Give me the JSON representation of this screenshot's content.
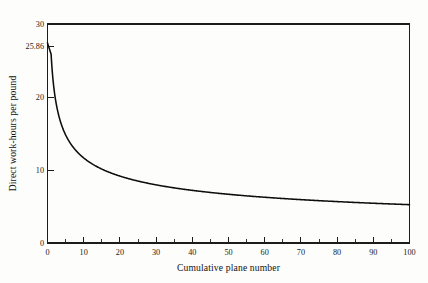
{
  "figure": {
    "background_color": "#fdfdfb",
    "ink_color": "#0d0d0d"
  },
  "chart_data": {
    "type": "line",
    "title": "",
    "subtitle": "",
    "xlabel": "Cumulative plane number",
    "ylabel": "Direct work-hours per pound",
    "xlim": [
      0,
      100
    ],
    "ylim": [
      0,
      30
    ],
    "grid": false,
    "legend": null,
    "x_ticks": [
      0,
      10,
      20,
      30,
      40,
      50,
      60,
      70,
      80,
      90,
      100
    ],
    "x_tick_labels": [
      "0",
      "10",
      "20",
      "30",
      "40",
      "50",
      "60",
      "70",
      "80",
      "90",
      "100"
    ],
    "x_minor_ticks": [
      5,
      15,
      25,
      35,
      45,
      55,
      65,
      75,
      85,
      95
    ],
    "y_ticks": [
      0,
      10,
      20,
      25.86,
      30
    ],
    "y_tick_labels": [
      "0",
      "10",
      "20",
      "25.86",
      "30"
    ],
    "annotations": [
      {
        "label": "25.86",
        "value": 25.86,
        "note": "first-unit direct work-hours per pound"
      }
    ],
    "series": [
      {
        "name": "Learning curve",
        "model": "y = 25.86 * n^(-0.352)",
        "x": [
          1,
          2,
          3,
          4,
          5,
          6,
          8,
          10,
          12,
          15,
          20,
          25,
          30,
          35,
          40,
          45,
          50,
          55,
          60,
          65,
          70,
          75,
          80,
          85,
          90,
          95,
          100
        ],
        "y": [
          25.86,
          20.26,
          17.63,
          15.88,
          14.65,
          13.72,
          12.38,
          11.44,
          10.75,
          9.96,
          8.97,
          8.29,
          7.78,
          7.38,
          7.06,
          6.79,
          6.56,
          6.36,
          6.18,
          6.02,
          5.88,
          5.75,
          5.63,
          5.53,
          5.43,
          5.34,
          5.25
        ]
      }
    ]
  },
  "axes": {
    "y_label_text": "Direct work-hours per pound",
    "x_label_text": "Cumulative plane number"
  }
}
